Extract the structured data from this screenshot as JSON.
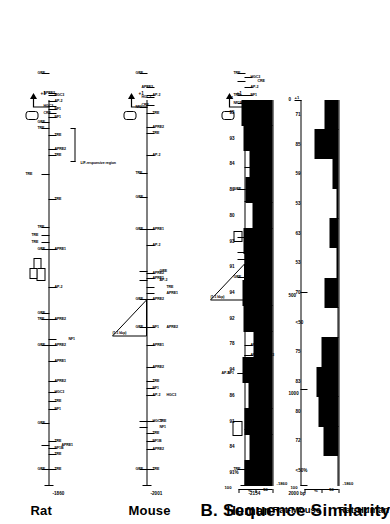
{
  "figure": {
    "panel_b_title": "B. Sequence Similarity",
    "scale_ticks": [
      "0",
      "500",
      "1000"
    ],
    "scale_label": "2000 bp",
    "tss_label": "+1"
  },
  "maps": [
    {
      "species": "Rat",
      "start_coord": "-1860",
      "end_label": "+1",
      "insert_label": "",
      "annotation": "LIF-responsive region",
      "sites": [
        {
          "label": "TRE",
          "x": 16,
          "row": 0
        },
        {
          "label": "GRE",
          "x": 16,
          "row": 1
        },
        {
          "label": "TRE",
          "x": 31,
          "row": 0
        },
        {
          "label": "NF1B",
          "x": 37,
          "row": 0
        },
        {
          "label": "TRE",
          "x": 44,
          "row": 0
        },
        {
          "label": "APRE1",
          "x": 40,
          "row": 2
        },
        {
          "label": "GRE",
          "x": 62,
          "row": 1
        },
        {
          "label": "NF1",
          "x": 76,
          "row": 0
        },
        {
          "label": "TRE",
          "x": 84,
          "row": 0
        },
        {
          "label": "HGC3",
          "x": 93,
          "row": 0
        },
        {
          "label": "APRE2",
          "x": 104,
          "row": 0
        },
        {
          "label": "APRE1",
          "x": 124,
          "row": 0
        },
        {
          "label": "GRE",
          "x": 140,
          "row": 1
        },
        {
          "label": "APRE2",
          "x": 140,
          "row": 0
        },
        {
          "label": "NF1",
          "x": 146,
          "row": 3
        },
        {
          "label": "TRE",
          "x": 166,
          "row": 1
        },
        {
          "label": "GRE",
          "x": 172,
          "row": 1
        },
        {
          "label": "APRE2",
          "x": 166,
          "row": 0
        },
        {
          "label": "AP-2",
          "x": 198,
          "row": 0
        },
        {
          "label": "GRE",
          "x": 236,
          "row": 1
        },
        {
          "label": "APRE1",
          "x": 236,
          "row": 0
        },
        {
          "label": "TRE",
          "x": 243,
          "row": 4
        },
        {
          "label": "TRE",
          "x": 250,
          "row": 4
        },
        {
          "label": "TRE",
          "x": 258,
          "row": 1
        },
        {
          "label": "TRE",
          "x": 286,
          "row": 0
        },
        {
          "label": "TRE",
          "x": 311,
          "row": 5
        },
        {
          "label": "TRE",
          "x": 330,
          "row": 0
        },
        {
          "label": "APRE2",
          "x": 336,
          "row": 0
        },
        {
          "label": "TRE",
          "x": 350,
          "row": 0
        },
        {
          "label": "TRE",
          "x": 357,
          "row": 1
        },
        {
          "label": "GRE",
          "x": 363,
          "row": 1
        },
        {
          "label": "NF1",
          "x": 368,
          "row": 0
        },
        {
          "label": "NF1",
          "x": 376,
          "row": 0
        },
        {
          "label": "AP-2",
          "x": 384,
          "row": 0
        },
        {
          "label": "HGC3",
          "x": 390,
          "row": 0
        },
        {
          "label": "CRE",
          "x": 372,
          "row": 6
        },
        {
          "label": "HGC3",
          "x": 379,
          "row": 6
        },
        {
          "label": "APRE2",
          "x": 392,
          "row": 6
        },
        {
          "label": "GRE",
          "x": 412,
          "row": 1
        }
      ]
    },
    {
      "species": "Mouse",
      "start_coord": "-2001",
      "end_label": "+1",
      "insert_label": "(1.1 kbp)",
      "annotation": "",
      "sites": [
        {
          "label": "TRE",
          "x": 16,
          "row": 0
        },
        {
          "label": "GRE",
          "x": 16,
          "row": 1
        },
        {
          "label": "APRE2",
          "x": 36,
          "row": 0
        },
        {
          "label": "NF1B",
          "x": 44,
          "row": 0
        },
        {
          "label": "TRE",
          "x": 52,
          "row": 0
        },
        {
          "label": "NF1",
          "x": 58,
          "row": 2
        },
        {
          "label": "TRE",
          "x": 64,
          "row": 2
        },
        {
          "label": "HGC3",
          "x": 64,
          "row": 0
        },
        {
          "label": "AP-2",
          "x": 90,
          "row": 0
        },
        {
          "label": "HGC3",
          "x": 90,
          "row": 3
        },
        {
          "label": "NF1",
          "x": 97,
          "row": 0
        },
        {
          "label": "TRE",
          "x": 104,
          "row": 0
        },
        {
          "label": "APRE2",
          "x": 118,
          "row": 0
        },
        {
          "label": "APRE1",
          "x": 140,
          "row": 0
        },
        {
          "label": "GRE",
          "x": 158,
          "row": 1
        },
        {
          "label": "NF1",
          "x": 158,
          "row": 0
        },
        {
          "label": "APRE2",
          "x": 158,
          "row": 3
        },
        {
          "label": "GRE",
          "x": 186,
          "row": 1
        },
        {
          "label": "APRE2",
          "x": 186,
          "row": 0
        },
        {
          "label": "APRE1",
          "x": 192,
          "row": 3
        },
        {
          "label": "TRE",
          "x": 198,
          "row": 3
        },
        {
          "label": "AP-2",
          "x": 205,
          "row": 2
        },
        {
          "label": "GRE",
          "x": 214,
          "row": 2
        },
        {
          "label": "APRE1",
          "x": 207,
          "row": 0
        },
        {
          "label": "APRE2",
          "x": 212,
          "row": 0
        },
        {
          "label": "AP-2",
          "x": 240,
          "row": 0
        },
        {
          "label": "GRE",
          "x": 256,
          "row": 1
        },
        {
          "label": "APRE1",
          "x": 256,
          "row": 0
        },
        {
          "label": "GRE",
          "x": 288,
          "row": 1
        },
        {
          "label": "TRE",
          "x": 312,
          "row": 1
        },
        {
          "label": "AP-2",
          "x": 330,
          "row": 0
        },
        {
          "label": "TRE",
          "x": 352,
          "row": 0
        },
        {
          "label": "APRE2",
          "x": 358,
          "row": 0
        },
        {
          "label": "TRE",
          "x": 372,
          "row": 0
        },
        {
          "label": "NF1",
          "x": 378,
          "row": 1
        },
        {
          "label": "AP-2",
          "x": 390,
          "row": 0
        },
        {
          "label": "CRE",
          "x": 380,
          "row": 6
        },
        {
          "label": "HGC3",
          "x": 388,
          "row": 6
        },
        {
          "label": "APRE2",
          "x": 398,
          "row": 6
        },
        {
          "label": "GRE",
          "x": 412,
          "row": 1
        }
      ]
    },
    {
      "species": "Human",
      "start_coord": "-2154",
      "end_label": "+1",
      "insert_label": "(1.1 kbp)",
      "annotation": "",
      "sites": [
        {
          "label": "TRE",
          "x": 16,
          "row": 1
        },
        {
          "label": "APRE1",
          "x": 56,
          "row": 0
        },
        {
          "label": "NF1",
          "x": 112,
          "row": 4
        },
        {
          "label": "AP-2",
          "x": 112,
          "row": 5
        },
        {
          "label": "TRE",
          "x": 121,
          "row": 0
        },
        {
          "label": "AP-2",
          "x": 130,
          "row": 0
        },
        {
          "label": "APRE2",
          "x": 140,
          "row": 0
        },
        {
          "label": "HGC3",
          "x": 130,
          "row": 3
        },
        {
          "label": "AP-2",
          "x": 168,
          "row": 0
        },
        {
          "label": "APRE2",
          "x": 196,
          "row": 0
        },
        {
          "label": "NF1",
          "x": 202,
          "row": 3
        },
        {
          "label": "GRE",
          "x": 208,
          "row": 1
        },
        {
          "label": "APRE1",
          "x": 232,
          "row": 0
        },
        {
          "label": "GRE",
          "x": 226,
          "row": 2
        },
        {
          "label": "GRE",
          "x": 233,
          "row": 2
        },
        {
          "label": "TRE",
          "x": 248,
          "row": 2
        },
        {
          "label": "APRE1",
          "x": 284,
          "row": 0
        },
        {
          "label": "GRE",
          "x": 296,
          "row": 1
        },
        {
          "label": "TRE",
          "x": 296,
          "row": 2
        },
        {
          "label": "NF1",
          "x": 318,
          "row": 0
        },
        {
          "label": "TRE",
          "x": 338,
          "row": 0
        },
        {
          "label": "APRE1",
          "x": 358,
          "row": 0
        },
        {
          "label": "TRE",
          "x": 366,
          "row": 0
        },
        {
          "label": "NF1B",
          "x": 382,
          "row": 1
        },
        {
          "label": "TRE",
          "x": 390,
          "row": 1
        },
        {
          "label": "NF1",
          "x": 390,
          "row": 0
        },
        {
          "label": "AP-2",
          "x": 398,
          "row": 0
        },
        {
          "label": "HGC3",
          "x": 408,
          "row": 0
        },
        {
          "label": "CRE",
          "x": 404,
          "row": 2
        },
        {
          "label": "TRE",
          "x": 412,
          "row": 1
        }
      ]
    }
  ],
  "chart_data": [
    {
      "type": "area",
      "title": "Rat-Mouse",
      "ylabel": "%",
      "ylim": [
        50,
        100
      ],
      "yticks": [
        "100",
        "%",
        "50"
      ],
      "xlabel": "",
      "x_start_label": "-1860",
      "x_end_label": "+1",
      "segments": [
        {
          "label": "91%",
          "value": 91
        },
        {
          "label": "84",
          "value": 84
        },
        {
          "label": "91",
          "value": 91
        },
        {
          "label": "86",
          "value": 86
        },
        {
          "label": "94",
          "value": 94
        },
        {
          "label": "78",
          "value": 78
        },
        {
          "label": "92",
          "value": 92
        },
        {
          "label": "94",
          "value": 94
        },
        {
          "label": "91",
          "value": 91
        },
        {
          "label": "93",
          "value": 93
        },
        {
          "label": "80",
          "value": 80
        },
        {
          "label": "89",
          "value": 89
        },
        {
          "label": "84",
          "value": 84
        },
        {
          "label": "93",
          "value": 93
        },
        {
          "label": "95",
          "value": 95
        }
      ]
    },
    {
      "type": "area",
      "title": "Rat-Human",
      "ylabel": "%",
      "ylim": [
        50,
        100
      ],
      "yticks": [
        "100",
        "%",
        "50"
      ],
      "xlabel": "",
      "x_start_label": "-1860",
      "x_end_label": "+1",
      "segments": [
        {
          "label": "<50%",
          "value": 49
        },
        {
          "label": "72",
          "value": 72
        },
        {
          "label": "80",
          "value": 80
        },
        {
          "label": "83",
          "value": 83
        },
        {
          "label": "75",
          "value": 75
        },
        {
          "label": "<50",
          "value": 49
        },
        {
          "label": "70",
          "value": 70
        },
        {
          "label": "53",
          "value": 53
        },
        {
          "label": "63",
          "value": 63
        },
        {
          "label": "53",
          "value": 53
        },
        {
          "label": "59",
          "value": 59
        },
        {
          "label": "85",
          "value": 85
        },
        {
          "label": "71",
          "value": 71
        }
      ]
    }
  ]
}
